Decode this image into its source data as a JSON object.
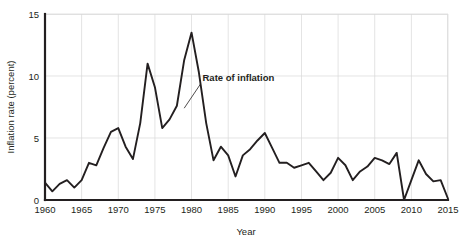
{
  "chart_data": {
    "type": "line",
    "title": "",
    "xlabel": "Year",
    "ylabel": "Inflation rate (percent)",
    "xlim": [
      1960,
      2015
    ],
    "ylim": [
      0,
      15
    ],
    "xticks": [
      1960,
      1965,
      1970,
      1975,
      1980,
      1985,
      1990,
      1995,
      2000,
      2005,
      2010,
      2015
    ],
    "yticks": [
      0,
      5,
      10,
      15
    ],
    "grid": true,
    "legend": "none",
    "annotations": [
      {
        "text": "Rate of inflation",
        "x": 1981.5,
        "y": 9.6,
        "points_to_x": 1979.0,
        "points_to_y": 7.4
      }
    ],
    "series": [
      {
        "name": "Rate of inflation",
        "color": "#231f20",
        "x": [
          1960,
          1961,
          1962,
          1963,
          1964,
          1965,
          1966,
          1967,
          1968,
          1969,
          1970,
          1971,
          1972,
          1973,
          1974,
          1975,
          1976,
          1977,
          1978,
          1979,
          1980,
          1981,
          1982,
          1983,
          1984,
          1985,
          1986,
          1987,
          1988,
          1989,
          1990,
          1991,
          1992,
          1993,
          1994,
          1995,
          1996,
          1997,
          1998,
          1999,
          2000,
          2001,
          2002,
          2003,
          2004,
          2005,
          2006,
          2007,
          2008,
          2009,
          2010,
          2011,
          2012,
          2013,
          2014,
          2015
        ],
        "values": [
          1.4,
          0.7,
          1.3,
          1.6,
          1.0,
          1.6,
          3.0,
          2.8,
          4.2,
          5.5,
          5.8,
          4.3,
          3.3,
          6.2,
          11.0,
          9.1,
          5.8,
          6.5,
          7.6,
          11.3,
          13.5,
          10.3,
          6.2,
          3.2,
          4.3,
          3.6,
          1.9,
          3.6,
          4.1,
          4.8,
          5.4,
          4.2,
          3.0,
          3.0,
          2.6,
          2.8,
          3.0,
          2.3,
          1.6,
          2.2,
          3.4,
          2.8,
          1.6,
          2.3,
          2.7,
          3.4,
          3.2,
          2.9,
          3.8,
          -0.4,
          1.6,
          3.2,
          2.1,
          1.5,
          1.6,
          0.1
        ]
      }
    ]
  },
  "axis": {
    "x_tick_labels": [
      "1960",
      "1965",
      "1970",
      "1975",
      "1980",
      "1985",
      "1990",
      "1995",
      "2000",
      "2005",
      "2010",
      "2015"
    ],
    "y_tick_labels": [
      "0",
      "5",
      "10",
      "15"
    ],
    "x_title": "Year",
    "y_title": "Inflation rate (percent)"
  },
  "annotation": {
    "label": "Rate of inflation"
  }
}
